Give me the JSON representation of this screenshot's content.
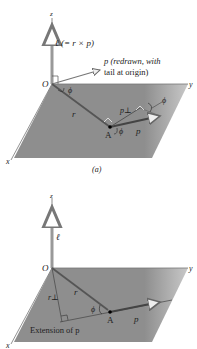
{
  "figure_a": {
    "caption": "(a)",
    "axes": {
      "x": "x",
      "y": "y",
      "z": "z"
    },
    "origin_label": "O",
    "point_label": "A",
    "angular_momentum_label": "ℓ (= r × p)",
    "l_symbol": "ℓ",
    "l_def": "(= r × p)",
    "p_redrawn_line1": "p (redrawn, with",
    "p_redrawn_line2": "tail at origin)",
    "r_label": "r",
    "p_label": "p",
    "p_perp_label": "p⊥",
    "phi_label": "ϕ"
  },
  "figure_b": {
    "axes": {
      "x": "x",
      "y": "y",
      "z": "z"
    },
    "origin_label": "O",
    "point_label": "A",
    "l_label": "ℓ",
    "r_label": "r",
    "r_perp_label": "r⊥",
    "p_label": "p",
    "phi_label": "ϕ",
    "extension_label": "Extension of p"
  },
  "colors": {
    "plane": "#8c8c8c",
    "axis": "#9a9a9a",
    "vector": "#555555",
    "text": "#222222"
  }
}
